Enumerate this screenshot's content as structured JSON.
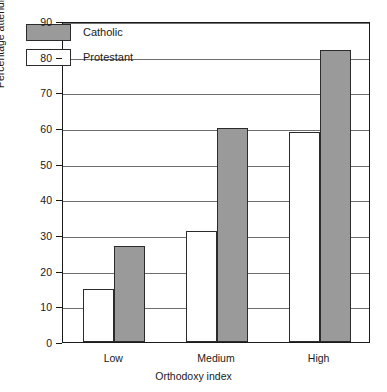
{
  "chart_data": {
    "type": "bar",
    "title": "",
    "xlabel": "Orthodoxy index",
    "ylabel": "Percentage attending church weekly",
    "categories": [
      "Low",
      "Medium",
      "High"
    ],
    "series": [
      {
        "name": "Protestant",
        "values": [
          15,
          31,
          59
        ],
        "color": "#ffffff"
      },
      {
        "name": "Catholic",
        "values": [
          27,
          60,
          82
        ],
        "color": "#9a9a9a"
      }
    ],
    "ylim": [
      0,
      90
    ],
    "yticks": [
      0,
      10,
      20,
      30,
      40,
      50,
      60,
      70,
      80,
      90
    ],
    "ytick_labels": [
      "0",
      "10",
      "20",
      "30",
      "40",
      "50",
      "60",
      "70",
      "80",
      "90"
    ],
    "grid": true,
    "grid_axis": "y",
    "legend_position": "upper-left-inside",
    "bar_order_in_group": [
      "Protestant",
      "Catholic"
    ]
  },
  "legend": {
    "items": [
      {
        "label": "Catholic",
        "swatch": "catholic"
      },
      {
        "label": "Protestant",
        "swatch": "protestant"
      }
    ]
  }
}
